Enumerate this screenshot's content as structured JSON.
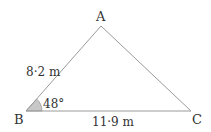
{
  "diagram": {
    "type": "triangle",
    "vertices": {
      "A": {
        "label": "A"
      },
      "B": {
        "label": "B"
      },
      "C": {
        "label": "C"
      }
    },
    "sides": {
      "AB": {
        "label": "8·2 m"
      },
      "BC": {
        "label": "11·9 m"
      }
    },
    "angles": {
      "B": {
        "label": "48°"
      }
    },
    "colors": {
      "line": "#9a9a9a",
      "angle_fill": "#c8c8c8",
      "text": "#333333"
    }
  }
}
